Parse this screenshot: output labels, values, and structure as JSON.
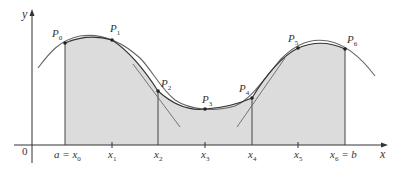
{
  "figure": {
    "colors": {
      "fill": "#dcdcdc",
      "curve": "#555555",
      "axis": "#333333",
      "parabola": "#333333"
    },
    "axes": {
      "x_label": "x",
      "y_label": "y",
      "origin_label": "0"
    },
    "x_ticks": [
      {
        "label_html": "a = x",
        "sub": "0",
        "full": "a = x0"
      },
      {
        "label": "x",
        "sub": "1",
        "full": "x1"
      },
      {
        "label": "x",
        "sub": "2",
        "full": "x2"
      },
      {
        "label": "x",
        "sub": "3",
        "full": "x3"
      },
      {
        "label": "x",
        "sub": "4",
        "full": "x4"
      },
      {
        "label": "x",
        "sub": "5",
        "full": "x5"
      },
      {
        "label": "x",
        "sub": "6",
        "suffix": " = b",
        "full": "x6 = b"
      }
    ],
    "points": [
      {
        "label": "P",
        "sub": "0"
      },
      {
        "label": "P",
        "sub": "1"
      },
      {
        "label": "P",
        "sub": "2"
      },
      {
        "label": "P",
        "sub": "3"
      },
      {
        "label": "P",
        "sub": "4"
      },
      {
        "label": "P",
        "sub": "5"
      },
      {
        "label": "P",
        "sub": "6"
      }
    ]
  }
}
